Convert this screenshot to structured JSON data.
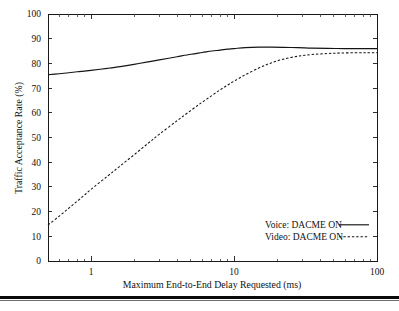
{
  "figure": {
    "background_color": "#ffffff",
    "foreground_color": "#141414",
    "bottom_rule_color": "#0a0a0a"
  },
  "chart_data": {
    "type": "line",
    "title": "",
    "xlabel": "Maximum End-to-End Delay Requested (ms)",
    "ylabel": "Traffic Acceptance Rate (%)",
    "xscale": "log",
    "yscale": "linear",
    "xlim": [
      0.5,
      100
    ],
    "ylim": [
      0,
      100
    ],
    "grid": false,
    "legend_position": "lower right inside",
    "xticks": [
      1,
      10,
      100
    ],
    "xtick_labels": [
      "1",
      "10",
      "100"
    ],
    "yticks": [
      0,
      10,
      20,
      30,
      40,
      50,
      60,
      70,
      80,
      90,
      100
    ],
    "ytick_labels": [
      "0",
      "10",
      "20",
      "30",
      "40",
      "50",
      "60",
      "70",
      "80",
      "90",
      "100"
    ],
    "x_minor_ticks": [
      0.6,
      0.7,
      0.8,
      0.9,
      2,
      3,
      4,
      5,
      6,
      7,
      8,
      9,
      20,
      30,
      40,
      50,
      60,
      70,
      80,
      90
    ],
    "series": [
      {
        "name": "Voice: DACME ON",
        "style": "solid",
        "color": "#141414",
        "x": [
          0.5,
          0.6,
          0.7,
          0.8,
          0.9,
          1.0,
          1.3,
          1.6,
          2.0,
          2.5,
          3.0,
          4.0,
          5.0,
          6.0,
          7.0,
          8.0,
          9.0,
          10.0,
          12.0,
          15.0,
          18.0,
          22.0,
          28.0,
          35.0,
          45.0,
          60.0,
          75.0,
          100.0
        ],
        "y": [
          75.4,
          75.8,
          76.2,
          76.6,
          76.9,
          77.2,
          78.0,
          78.7,
          79.6,
          80.6,
          81.4,
          82.7,
          83.7,
          84.4,
          85.0,
          85.4,
          85.8,
          86.0,
          86.4,
          86.6,
          86.6,
          86.5,
          86.4,
          86.2,
          86.1,
          86.0,
          86.0,
          86.0
        ]
      },
      {
        "name": "Video: DACME ON",
        "style": "dashed",
        "color": "#141414",
        "x": [
          0.5,
          0.6,
          0.7,
          0.8,
          0.9,
          1.0,
          1.3,
          1.6,
          2.0,
          2.5,
          3.0,
          4.0,
          5.0,
          6.0,
          7.0,
          8.0,
          9.0,
          10.0,
          12.0,
          15.0,
          18.0,
          22.0,
          28.0,
          35.0,
          45.0,
          55.0,
          70.0,
          85.0,
          100.0
        ],
        "y": [
          14.6,
          18.2,
          21.4,
          24.2,
          26.7,
          29.0,
          34.3,
          38.5,
          43.0,
          47.6,
          51.3,
          56.8,
          61.0,
          64.3,
          67.0,
          69.3,
          71.2,
          72.8,
          75.4,
          78.2,
          80.1,
          81.7,
          82.9,
          83.6,
          84.0,
          84.2,
          84.3,
          84.3,
          84.3
        ]
      }
    ],
    "legend": [
      {
        "label": "Voice: DACME ON",
        "style": "solid"
      },
      {
        "label": "Video: DACME ON",
        "style": "dashed"
      }
    ]
  }
}
